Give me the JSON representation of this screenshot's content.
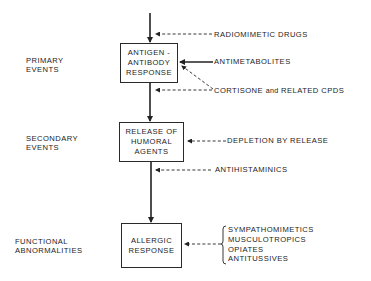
{
  "diagram": {
    "stages": [
      {
        "id": "primary",
        "label_lines": [
          "PRIMARY",
          "EVENTS"
        ]
      },
      {
        "id": "secondary",
        "label_lines": [
          "SECONDARY",
          "EVENTS"
        ]
      },
      {
        "id": "functional",
        "label_lines": [
          "FUNCTIONAL",
          "ABNORMALITIES"
        ]
      }
    ],
    "boxes": [
      {
        "id": "antigen-antibody-response",
        "lines": [
          "ANTIGEN -",
          "ANTIBODY",
          "RESPONSE"
        ]
      },
      {
        "id": "release-of-humoral-agents",
        "lines": [
          "RELEASE OF",
          "HUMORAL",
          "AGENTS"
        ]
      },
      {
        "id": "allergic-response",
        "lines": [
          "ALLERGIC",
          "RESPONSE"
        ]
      }
    ],
    "interventions": {
      "radiomimetic": {
        "label": "RADIOMIMETIC DRUGS",
        "style": "dashed",
        "target": "flow-into-antigen-antibody-response"
      },
      "antimetabolites": {
        "label": "ANTIMETABOLITES",
        "style": "solid",
        "target": "antigen-antibody-response"
      },
      "cortisone": {
        "label_main": "CORTISONE",
        "label_and": "and",
        "label_rest": "RELATED CPDS",
        "style": "dashed",
        "target": "antigen-antibody-response and flow to release"
      },
      "depletion": {
        "label": "DEPLETION BY RELEASE",
        "style": "dashed",
        "target": "release-of-humoral-agents"
      },
      "antihistaminics": {
        "label": "ANTIHISTAMINICS",
        "style": "dashed",
        "target": "flow-into-allergic-response"
      },
      "functional_drugs": {
        "style": "dashed",
        "bracketed": true,
        "target": "allergic-response",
        "items": [
          "SYMPATHOMIMETICS",
          "MUSCULOTROPICS",
          "OPIATES",
          "ANTITUSSIVES"
        ]
      }
    },
    "colors": {
      "line": "#222222",
      "text": "#1c1c1c",
      "background": "#ffffff"
    }
  }
}
